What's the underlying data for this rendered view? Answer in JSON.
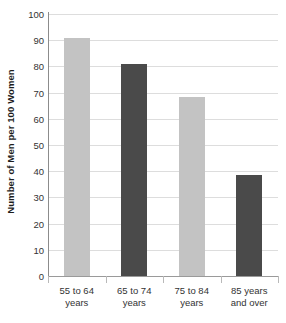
{
  "chart_data": {
    "type": "bar",
    "title": "",
    "subtitle": "",
    "xlabel": "",
    "ylabel": "Number of Men per 100 Women",
    "categories": [
      "55 to 64 years",
      "65 to 74 years",
      "75 to 84 years",
      "85 years and over"
    ],
    "category_lines": [
      [
        "55 to 64",
        "years"
      ],
      [
        "65 to 74",
        "years"
      ],
      [
        "75 to 84",
        "years"
      ],
      [
        "85 years",
        "and over"
      ]
    ],
    "values": [
      91,
      81,
      68.5,
      38.6
    ],
    "ylim": [
      0,
      100
    ],
    "yticks": [
      100,
      90,
      80,
      70,
      60,
      50,
      40,
      30,
      20,
      10,
      0
    ],
    "ytick_labels": [
      "100",
      "90",
      "80",
      "70",
      "60",
      "50",
      "40",
      "30",
      "20",
      "10",
      "0"
    ],
    "grid": true,
    "grid_axis": "y",
    "legend": false,
    "legend_position": "none",
    "bar_colors": [
      "#c3c3c3",
      "#4a4a4a",
      "#c3c3c3",
      "#4a4a4a"
    ],
    "colors": {
      "light_bar": "#c3c3c3",
      "dark_bar": "#4a4a4a",
      "gridline": "#dddddd",
      "axis_line": "#8c8c8c",
      "background": "#ffffff",
      "text": "#333333"
    }
  }
}
